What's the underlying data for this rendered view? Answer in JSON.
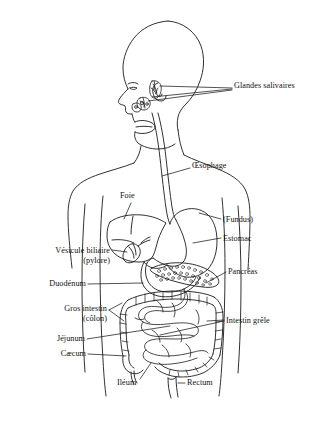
{
  "figure": {
    "language": "fr",
    "type": "anatomical-diagram",
    "background_color": "#ffffff",
    "line_color": "#1a1a1a",
    "text_color": "#111111"
  },
  "labels": {
    "glandes_salivaires": "Glandes salivaires",
    "oesophage": "Œsophage",
    "foie": "Foie",
    "fundus": "(Fundus)",
    "estomac": "Estomac",
    "vesicule_biliaire": "Vésicule biliaire",
    "pylore": "(pylore)",
    "pancreas": "Pancréas",
    "duodenum": "Duodénum",
    "gros_intestin": "Gros intestin",
    "colon": "(côlon)",
    "intestin_grele": "Intestin grêle",
    "jejunum": "Jéjunum",
    "caecum": "Cæcum",
    "ileum": "Iléum",
    "rectum": "Rectum"
  },
  "organs": [
    {
      "name": "salivary-glands",
      "label_key": "glandes_salivaires"
    },
    {
      "name": "esophagus",
      "label_key": "oesophage"
    },
    {
      "name": "liver",
      "label_key": "foie"
    },
    {
      "name": "stomach-fundus",
      "label_key": "fundus"
    },
    {
      "name": "stomach",
      "label_key": "estomac"
    },
    {
      "name": "gallbladder",
      "label_key": "vesicule_biliaire"
    },
    {
      "name": "pylorus",
      "label_key": "pylore"
    },
    {
      "name": "pancreas",
      "label_key": "pancreas"
    },
    {
      "name": "duodenum",
      "label_key": "duodenum"
    },
    {
      "name": "large-intestine",
      "label_key": "gros_intestin"
    },
    {
      "name": "colon",
      "label_key": "colon"
    },
    {
      "name": "small-intestine",
      "label_key": "intestin_grele"
    },
    {
      "name": "jejunum",
      "label_key": "jejunum"
    },
    {
      "name": "caecum",
      "label_key": "caecum"
    },
    {
      "name": "ileum",
      "label_key": "ileum"
    },
    {
      "name": "rectum",
      "label_key": "rectum"
    }
  ]
}
